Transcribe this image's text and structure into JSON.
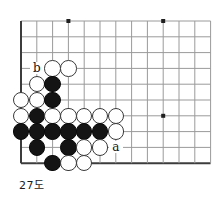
{
  "diagram": {
    "caption": "27도",
    "type": "go-board-problem",
    "board": {
      "left_px": 21,
      "top_px": 21,
      "spacing_px": 15.8,
      "cols": 12,
      "rows": 10,
      "line_color": "#9a9a9a",
      "edge_color": "#3c3c3c",
      "background": "#ffffff",
      "star_points": [
        {
          "col": 3,
          "row": 0
        },
        {
          "col": 9,
          "row": 0
        },
        {
          "col": 9,
          "row": 6
        }
      ]
    },
    "stones": [
      {
        "col": 2,
        "row": 3,
        "color": "white"
      },
      {
        "col": 3,
        "row": 3,
        "color": "white"
      },
      {
        "col": 1,
        "row": 4,
        "color": "white"
      },
      {
        "col": 2,
        "row": 4,
        "color": "black"
      },
      {
        "col": 0,
        "row": 5,
        "color": "white"
      },
      {
        "col": 1,
        "row": 5,
        "color": "white"
      },
      {
        "col": 2,
        "row": 5,
        "color": "black"
      },
      {
        "col": 0,
        "row": 6,
        "color": "white"
      },
      {
        "col": 1,
        "row": 6,
        "color": "black"
      },
      {
        "col": 2,
        "row": 6,
        "color": "white"
      },
      {
        "col": 3,
        "row": 6,
        "color": "white"
      },
      {
        "col": 4,
        "row": 6,
        "color": "white"
      },
      {
        "col": 5,
        "row": 6,
        "color": "white"
      },
      {
        "col": 6,
        "row": 6,
        "color": "white"
      },
      {
        "col": 0,
        "row": 7,
        "color": "black"
      },
      {
        "col": 1,
        "row": 7,
        "color": "black"
      },
      {
        "col": 2,
        "row": 7,
        "color": "black"
      },
      {
        "col": 3,
        "row": 7,
        "color": "black"
      },
      {
        "col": 4,
        "row": 7,
        "color": "black"
      },
      {
        "col": 5,
        "row": 7,
        "color": "black"
      },
      {
        "col": 6,
        "row": 7,
        "color": "white"
      },
      {
        "col": 1,
        "row": 8,
        "color": "black"
      },
      {
        "col": 3,
        "row": 8,
        "color": "black"
      },
      {
        "col": 4,
        "row": 8,
        "color": "white"
      },
      {
        "col": 5,
        "row": 8,
        "color": "white"
      },
      {
        "col": 2,
        "row": 9,
        "color": "black"
      },
      {
        "col": 3,
        "row": 9,
        "color": "white"
      },
      {
        "col": 4,
        "row": 9,
        "color": "white"
      }
    ],
    "labels": [
      {
        "text": "b",
        "col": 1,
        "row": 3
      },
      {
        "text": "a",
        "col": 6,
        "row": 8
      }
    ]
  }
}
